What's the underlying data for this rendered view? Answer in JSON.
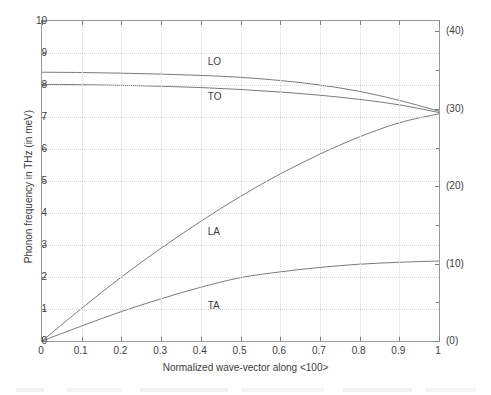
{
  "chart_data": {
    "type": "line",
    "title": "",
    "xlabel": "Normalized wave-vector along <100>",
    "ylabel": "Phonon frequency in THz (in meV)",
    "xlim": [
      0,
      1
    ],
    "ylim": [
      0,
      10
    ],
    "grid": true,
    "legend": "inline-curve-labels",
    "xticks": [
      "0",
      "0.1",
      "0.2",
      "0.3",
      "0.4",
      "0.5",
      "0.6",
      "0.7",
      "0.8",
      "0.9",
      "1"
    ],
    "xtick_values": [
      0,
      0.1,
      0.2,
      0.3,
      0.4,
      0.5,
      0.6,
      0.7,
      0.8,
      0.9,
      1
    ],
    "yticks": [
      "0",
      "1",
      "2",
      "3",
      "4",
      "5",
      "6",
      "7",
      "8",
      "9",
      "10"
    ],
    "ytick_values": [
      0,
      1,
      2,
      3,
      4,
      5,
      6,
      7,
      8,
      9,
      10
    ],
    "y2ticks": [
      "(0)",
      "(10)",
      "(20)",
      "(30)",
      "(40)"
    ],
    "y2tick_values": [
      0,
      2.418,
      4.836,
      7.254,
      9.672
    ],
    "y2_unit": "meV",
    "series": [
      {
        "name": "LO",
        "label": "LO",
        "label_x": 0.42,
        "label_y": 8.72,
        "color": "#6b6b6b",
        "x": [
          0,
          0.1,
          0.2,
          0.3,
          0.4,
          0.5,
          0.6,
          0.7,
          0.8,
          0.9,
          1
        ],
        "values": [
          8.4,
          8.39,
          8.37,
          8.34,
          8.3,
          8.24,
          8.14,
          8.0,
          7.8,
          7.52,
          7.18
        ]
      },
      {
        "name": "TO",
        "label": "TO",
        "label_x": 0.42,
        "label_y": 7.62,
        "color": "#6b6b6b",
        "x": [
          0,
          0.1,
          0.2,
          0.3,
          0.4,
          0.5,
          0.6,
          0.7,
          0.8,
          0.9,
          1
        ],
        "values": [
          8.02,
          8.01,
          7.99,
          7.96,
          7.92,
          7.86,
          7.78,
          7.68,
          7.55,
          7.38,
          7.14
        ]
      },
      {
        "name": "LA",
        "label": "LA",
        "label_x": 0.42,
        "label_y": 3.42,
        "color": "#6b6b6b",
        "x": [
          0,
          0.1,
          0.2,
          0.3,
          0.4,
          0.5,
          0.6,
          0.7,
          0.8,
          0.9,
          1
        ],
        "values": [
          0,
          1.02,
          2.0,
          2.9,
          3.74,
          4.52,
          5.22,
          5.84,
          6.38,
          6.82,
          7.1
        ]
      },
      {
        "name": "TA",
        "label": "TA",
        "label_x": 0.42,
        "label_y": 1.08,
        "color": "#6b6b6b",
        "x": [
          0,
          0.1,
          0.2,
          0.3,
          0.4,
          0.5,
          0.6,
          0.7,
          0.8,
          0.9,
          1
        ],
        "values": [
          0,
          0.47,
          0.92,
          1.32,
          1.68,
          1.98,
          2.16,
          2.3,
          2.4,
          2.46,
          2.5
        ]
      }
    ]
  }
}
